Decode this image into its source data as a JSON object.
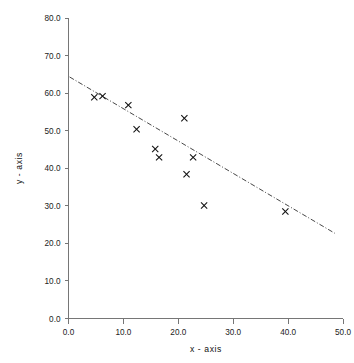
{
  "chart_data": {
    "type": "scatter",
    "title": "",
    "xlabel": "x - axis",
    "ylabel": "y - axis",
    "xlim": [
      0.0,
      50.0
    ],
    "ylim": [
      0.0,
      80.0
    ],
    "xticks": [
      "0.0",
      "10.0",
      "20.0",
      "30.0",
      "40.0",
      "50.0"
    ],
    "yticks": [
      "0.0",
      "10.0",
      "20.0",
      "30.0",
      "40.0",
      "50.0",
      "60.0",
      "70.0",
      "80.0"
    ],
    "xtick_values": [
      0,
      10,
      20,
      30,
      40,
      50
    ],
    "ytick_values": [
      0,
      10,
      20,
      30,
      40,
      50,
      60,
      70,
      80
    ],
    "grid": false,
    "legend": "none",
    "marker_style": "x-cross",
    "marker_color": "#111111",
    "series": [
      {
        "name": "data",
        "x": [
          4.7,
          6.2,
          10.9,
          12.4,
          15.8,
          16.5,
          21.1,
          21.5,
          22.7,
          24.7,
          39.5
        ],
        "y": [
          58.9,
          59.2,
          56.8,
          50.4,
          45.1,
          42.9,
          53.3,
          38.4,
          42.9,
          30.1,
          28.5
        ]
      }
    ],
    "trend_line": {
      "style": "dash-dot",
      "color": "#333333",
      "x_start": 0.2,
      "y_start": 64.3,
      "x_end": 48.5,
      "y_end": 22.7
    }
  },
  "axes": {
    "x_title": "x - axis",
    "y_title": "y - axis"
  }
}
